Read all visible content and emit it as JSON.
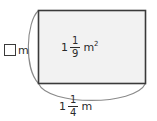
{
  "figure": {
    "shape": "rectangle",
    "fill_color": "#f2f2f2",
    "stroke_color": "#3a3a3a",
    "brace_color": "#8a8a8a",
    "background_color": "#ffffff"
  },
  "area_label": {
    "whole": "1",
    "numerator": "1",
    "denominator": "9",
    "unit": "m",
    "exponent": "2",
    "full_text": "1 1/9 m2"
  },
  "width_label": {
    "whole": "1",
    "numerator": "1",
    "denominator": "4",
    "unit": "m",
    "full_text": "1 1/4 m"
  },
  "height_label": {
    "answer_value": "",
    "unit": "m",
    "full_text": "? m"
  }
}
